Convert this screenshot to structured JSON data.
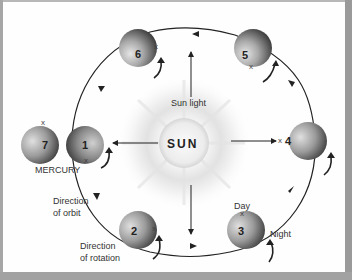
{
  "diagram": {
    "title_hidden": "",
    "sun": {
      "label": "SUN"
    },
    "sunlight_label": "Sun light",
    "mercury_label": "MERCURY",
    "direction_of_orbit": [
      "Direction",
      "of orbit"
    ],
    "direction_of_rotation": [
      "Direction",
      "of rotation"
    ],
    "day_label": "Day",
    "night_label": "Night",
    "marker": "x",
    "positions": [
      {
        "id": "1",
        "label": "1"
      },
      {
        "id": "2",
        "label": "2"
      },
      {
        "id": "3",
        "label": "3"
      },
      {
        "id": "4",
        "label": "4"
      },
      {
        "id": "5",
        "label": "5"
      },
      {
        "id": "6",
        "label": "6"
      },
      {
        "id": "7",
        "label": "7"
      }
    ],
    "colors": {
      "background": "#ffffff",
      "border": "#a0a0a0",
      "planet_light": "#d8d8d8",
      "planet_dark": "#4a4a4a",
      "line": "#222222"
    }
  }
}
